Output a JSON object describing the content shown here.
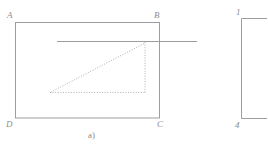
{
  "figure": {
    "caption": "a)",
    "stroke_color": "#9a9a9a",
    "dotted_color": "#b4b4b4",
    "label_color": "#8d8d8d",
    "background_color": "#ffffff",
    "main_rectangle": {
      "name": "rectangle-ABCD",
      "corner_labels": {
        "top_left": "A",
        "top_right": "B",
        "bottom_right": "C",
        "bottom_left": "D"
      },
      "geometry": {
        "x": 15,
        "y": 22,
        "width": 145,
        "height": 96
      }
    },
    "secant_line": {
      "name": "horizontal-secant-line",
      "geometry": {
        "x1": 57,
        "y1": 41,
        "x2": 197,
        "y2": 41
      }
    },
    "inscribed_triangle": {
      "name": "dotted-right-triangle",
      "style": "dotted",
      "vertices": {
        "apex": {
          "x": 145,
          "y": 42
        },
        "bottom_left": {
          "x": 51,
          "y": 92
        },
        "bottom_right": {
          "x": 145,
          "y": 92
        }
      }
    },
    "right_shape": {
      "name": "partial-rectangle-right",
      "corner_labels": {
        "top_left": "1",
        "bottom_left": "4"
      },
      "geometry": {
        "x": 241,
        "y": 18,
        "width": 40,
        "height": 100
      }
    }
  }
}
